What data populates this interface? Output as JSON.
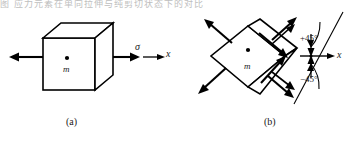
{
  "figure": {
    "top_text_strip": "图  应力元素在单向拉伸与纯剪切状态下的对比",
    "panels": [
      {
        "id": "a",
        "caption": "(a)",
        "body_label": "m",
        "center_dot": "•",
        "stress_label": "σ",
        "axis_label": "x",
        "description": "cube element under uniaxial tension along x"
      },
      {
        "id": "b",
        "caption": "(b)",
        "body_label": "m",
        "center_dot": "•",
        "axis_label": "x",
        "angle_positive": "+45°",
        "angle_negative": "−45°",
        "description": "element rotated 45 degrees showing shear stresses"
      }
    ],
    "colors": {
      "ink": "#000000",
      "paper": "#ffffff",
      "strip_text": "#8a8a8a"
    }
  }
}
